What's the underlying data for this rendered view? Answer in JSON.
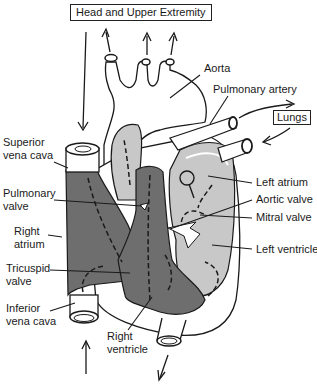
{
  "diagram": {
    "title_box": "Head and Upper Extremity",
    "lungs_box": "Lungs",
    "labels": {
      "aorta": "Aorta",
      "pulmonary_artery": "Pulmonary artery",
      "superior_vena_cava_1": "Superior",
      "superior_vena_cava_2": "vena cava",
      "pulmonary_valve_1": "Pulmonary",
      "pulmonary_valve_2": "valve",
      "right_atrium_1": "Right",
      "right_atrium_2": "atrium",
      "tricuspid_valve_1": "Tricuspid",
      "tricuspid_valve_2": "valve",
      "inferior_vena_cava_1": "Inferior",
      "inferior_vena_cava_2": "vena cava",
      "right_ventricle_1": "Right",
      "right_ventricle_2": "ventricle",
      "left_atrium": "Left atrium",
      "aortic_valve": "Aortic valve",
      "mitral_valve": "Mitral valve",
      "left_ventricle": "Left ventricle"
    },
    "colors": {
      "deoxygenated": "#6e6e6e",
      "oxygenated": "#c8c8c8",
      "outline": "#1a1a1a",
      "tissue": "#ffffff"
    }
  }
}
